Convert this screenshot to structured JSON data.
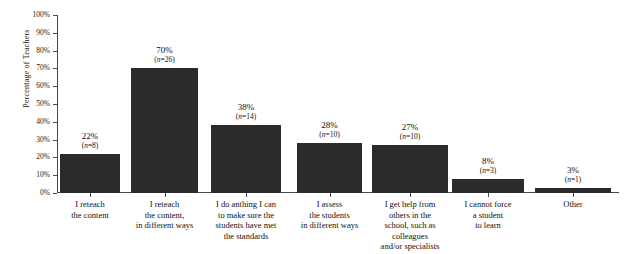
{
  "chart_data": {
    "type": "bar",
    "title": "",
    "xlabel": "",
    "ylabel": "Percentage of Teachers",
    "ylim": [
      0,
      100
    ],
    "grid": false,
    "legend": null,
    "bar_color": "#2b2b2b",
    "axis_color": "#4a4a4a",
    "ytick_labels": [
      "100%",
      "90%",
      "80%",
      "70%",
      "60%",
      "50%",
      "40%",
      "30%",
      "20%",
      "10%",
      "0%"
    ],
    "ytick_values": [
      100,
      90,
      80,
      70,
      60,
      50,
      40,
      30,
      20,
      10,
      0
    ],
    "categories": [
      "I reteach\nthe content",
      "I reteach\nthe content,\nin different ways",
      "I do anthing I can\nto make sure the\nstudents have met\nthe standards",
      "I assess\nthe students\nin different ways",
      "I get help from\nothers in the\nschool, such as\ncolleagues\nand/or specialists",
      "I cannot force\na student\nto learn",
      "Other"
    ],
    "values": [
      22,
      70,
      38,
      28,
      27,
      8,
      3
    ],
    "counts": [
      8,
      26,
      14,
      10,
      10,
      3,
      1
    ],
    "value_labels": [
      "22%",
      "70%",
      "38%",
      "28%",
      "27%",
      "8%",
      "3%"
    ],
    "count_labels": [
      "(n=8)",
      "(n=26)",
      "(n=14)",
      "(n=10)",
      "(n=10)",
      "(n=3)",
      "(n=1)"
    ]
  }
}
